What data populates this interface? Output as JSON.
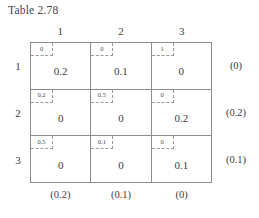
{
  "title": "Table 2.78",
  "table": {
    "column_headers": [
      "1",
      "2",
      "3"
    ],
    "row_headers": [
      "1",
      "2",
      "3"
    ],
    "rows": [
      [
        {
          "cost": "0",
          "allocation": "0.2"
        },
        {
          "cost": "0",
          "allocation": "0.1"
        },
        {
          "cost": "1",
          "allocation": "0"
        }
      ],
      [
        {
          "cost": "0.2",
          "allocation": "0"
        },
        {
          "cost": "0.5",
          "allocation": "0"
        },
        {
          "cost": "0",
          "allocation": "0.2"
        }
      ],
      [
        {
          "cost": "0.5",
          "allocation": "0"
        },
        {
          "cost": "0.1",
          "allocation": "0"
        },
        {
          "cost": "0",
          "allocation": "0.1"
        }
      ]
    ],
    "right_margins": [
      "(0)",
      "(0.2)",
      "(0.1)"
    ],
    "bottom_margins": [
      "(0.2)",
      "(0.1)",
      "(0)"
    ]
  },
  "colors": {
    "grid_line": "#8d8d8d",
    "dashed_line": "#9a9a9a",
    "text": "#3c3c3c",
    "background": "#ffffff"
  }
}
